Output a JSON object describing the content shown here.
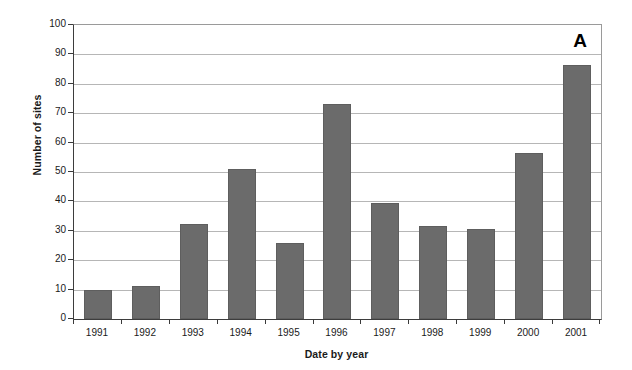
{
  "chart_data": {
    "type": "bar",
    "title": "",
    "panel_label": "A",
    "xlabel": "Date by year",
    "ylabel": "Number of sites",
    "categories": [
      "1991",
      "1992",
      "1993",
      "1994",
      "1995",
      "1996",
      "1997",
      "1998",
      "1999",
      "2000",
      "2001"
    ],
    "values": [
      10,
      11.3,
      32.2,
      51,
      26,
      73,
      39.5,
      31.5,
      30.5,
      56.5,
      86.5
    ],
    "ylim": [
      0,
      100
    ],
    "ytick_values": [
      0,
      10,
      20,
      30,
      40,
      50,
      60,
      70,
      80,
      90,
      100
    ],
    "ytick_labels": [
      "0",
      "10",
      "20",
      "30",
      "40",
      "50",
      "60",
      "70",
      "80",
      "90",
      "100"
    ],
    "grid": "horizontal",
    "legend": "none",
    "bar_color": "#6b6b6b",
    "gridline_color": "#b6b6b6",
    "axis_color": "#3d3d3d",
    "background_color": "#ffffff"
  }
}
